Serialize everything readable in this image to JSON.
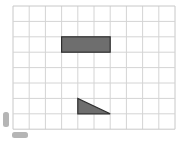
{
  "grid": {
    "columns": 10,
    "rows": 8,
    "origin_x": 13,
    "origin_y": 6,
    "cell_width": 16.2,
    "cell_height": 15.4,
    "line_color": "#d4d4d4",
    "border_color": "#c8c8c8"
  },
  "shapes": [
    {
      "type": "rectangle",
      "label": "rectangle",
      "col": 3,
      "row": 2,
      "width_cells": 3,
      "height_cells": 1,
      "fill": "#6e6e6e",
      "stroke": "#2e2e2e"
    },
    {
      "type": "right-triangle",
      "label": "triangle",
      "points_cells": [
        [
          4,
          6
        ],
        [
          4,
          7
        ],
        [
          6,
          7
        ]
      ],
      "fill": "#6e6e6e",
      "stroke": "#2e2e2e"
    }
  ],
  "marks": [
    {
      "name": "vertical-smudge",
      "x": 3,
      "y": 112,
      "w": 6,
      "h": 15,
      "color": "#a8a8a8"
    },
    {
      "name": "horizontal-smudge",
      "x": 12,
      "y": 132,
      "w": 16,
      "h": 6,
      "color": "#a8a8a8"
    }
  ]
}
